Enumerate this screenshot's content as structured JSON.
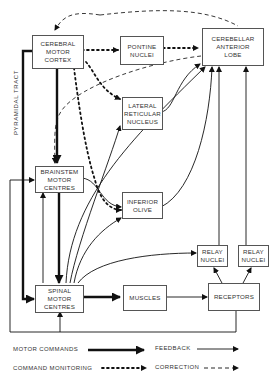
{
  "diagram": {
    "nodes": {
      "cerebral_motor_cortex": {
        "lines": [
          "CEREBRAL",
          "MOTOR",
          "CORTEX"
        ]
      },
      "pontine_nuclei": {
        "lines": [
          "PONTINE",
          "NUCLEI"
        ]
      },
      "cerebellar_anterior_lobe": {
        "lines": [
          "CEREBELLAR",
          "ANTERIOR",
          "LOBE"
        ]
      },
      "lateral_reticular_nucleus": {
        "lines": [
          "LATERAL",
          "RETICULAR",
          "NUCLEUS"
        ]
      },
      "brainstem_motor_centres": {
        "lines": [
          "BRAINSTEM",
          "MOTOR",
          "CENTRES"
        ]
      },
      "inferior_olive": {
        "lines": [
          "INFERIOR",
          "OLIVE"
        ]
      },
      "relay_nuclei_1": {
        "lines": [
          "RELAY",
          "NUCLEI"
        ]
      },
      "relay_nuclei_2": {
        "lines": [
          "RELAY",
          "NUCLEI"
        ]
      },
      "spinal_motor_centres": {
        "lines": [
          "SPINAL",
          "MOTOR",
          "CENTRES"
        ]
      },
      "muscles": {
        "lines": [
          "MUSCLES"
        ]
      },
      "receptors": {
        "lines": [
          "RECEPTORS"
        ]
      }
    },
    "side_label": "PYRAMIDAL TRACT",
    "legend": {
      "motor_commands": "MOTOR COMMANDS",
      "feedback": "FEEDBACK",
      "command_monitoring": "COMMAND MONITORING",
      "correction": "CORRECTION"
    },
    "edges": [
      {
        "from": "cerebral_motor_cortex",
        "to": "pontine_nuclei",
        "type": "command_monitoring"
      },
      {
        "from": "pontine_nuclei",
        "to": "cerebellar_anterior_lobe",
        "type": "command_monitoring"
      },
      {
        "from": "cerebral_motor_cortex",
        "to": "lateral_reticular_nucleus",
        "type": "command_monitoring"
      },
      {
        "from": "cerebral_motor_cortex",
        "to": "inferior_olive",
        "type": "command_monitoring"
      },
      {
        "from": "cerebral_motor_cortex",
        "to": "brainstem_motor_centres",
        "type": "motor_commands"
      },
      {
        "from": "cerebral_motor_cortex",
        "to": "spinal_motor_centres",
        "type": "motor_commands",
        "label": "PYRAMIDAL TRACT"
      },
      {
        "from": "brainstem_motor_centres",
        "to": "spinal_motor_centres",
        "type": "motor_commands"
      },
      {
        "from": "spinal_motor_centres",
        "to": "muscles",
        "type": "motor_commands"
      },
      {
        "from": "muscles",
        "to": "receptors",
        "type": "feedback"
      },
      {
        "from": "receptors",
        "to": "relay_nuclei_1",
        "type": "feedback"
      },
      {
        "from": "receptors",
        "to": "relay_nuclei_2",
        "type": "feedback"
      },
      {
        "from": "relay_nuclei_1",
        "to": "cerebellar_anterior_lobe",
        "type": "feedback"
      },
      {
        "from": "relay_nuclei_2",
        "to": "cerebellar_anterior_lobe",
        "type": "feedback"
      },
      {
        "from": "lateral_reticular_nucleus",
        "to": "cerebellar_anterior_lobe",
        "type": "feedback"
      },
      {
        "from": "inferior_olive",
        "to": "cerebellar_anterior_lobe",
        "type": "feedback"
      },
      {
        "from": "brainstem_motor_centres",
        "to": "inferior_olive",
        "type": "feedback"
      },
      {
        "from": "spinal_motor_centres",
        "to": "lateral_reticular_nucleus",
        "type": "feedback"
      },
      {
        "from": "spinal_motor_centres",
        "to": "inferior_olive",
        "type": "feedback"
      },
      {
        "from": "spinal_motor_centres",
        "to": "relay_nuclei_1",
        "type": "feedback"
      },
      {
        "from": "spinal_motor_centres",
        "to": "cerebellar_anterior_lobe",
        "type": "feedback"
      },
      {
        "from": "receptors",
        "to": "spinal_motor_centres",
        "type": "feedback"
      },
      {
        "from": "receptors",
        "to": "brainstem_motor_centres",
        "type": "feedback"
      },
      {
        "from": "cerebellar_anterior_lobe",
        "to": "cerebral_motor_cortex",
        "type": "correction"
      },
      {
        "from": "cerebellar_anterior_lobe",
        "to": "brainstem_motor_centres",
        "type": "correction"
      }
    ]
  }
}
